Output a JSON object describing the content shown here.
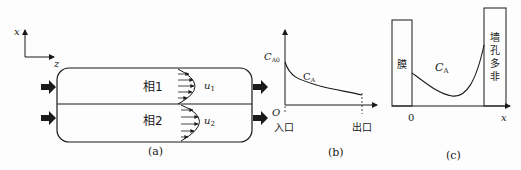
{
  "figure": {
    "panels": [
      {
        "id": "a",
        "caption": "(a)",
        "axes": {
          "vertical": "x",
          "horizontal": "z"
        },
        "phases": [
          {
            "label": "相1",
            "velocity": "u",
            "velocity_sub": "1"
          },
          {
            "label": "相2",
            "velocity": "u",
            "velocity_sub": "2"
          }
        ]
      },
      {
        "id": "b",
        "caption": "(b)",
        "y_label": "C",
        "y_label_sub": "A0",
        "curve_label": "C",
        "curve_label_sub": "A",
        "origin": "O",
        "inlet": "入口",
        "outlet": "出口"
      },
      {
        "id": "c",
        "caption": "(c)",
        "left_wall": "膜",
        "right_wall": [
          "非",
          "多",
          "孔",
          "墙"
        ],
        "curve_label": "C",
        "curve_label_sub": "A",
        "origin": "0",
        "x_label": "x"
      }
    ]
  },
  "colors": {
    "ink": "#1a1a1a",
    "background": "#fdfdfd"
  }
}
